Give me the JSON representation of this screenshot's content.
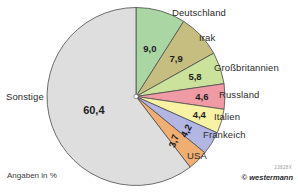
{
  "figure": {
    "footnote": "Angaben in %",
    "credit": "© westermann",
    "credit_code": "23828X"
  },
  "chart_data": {
    "type": "pie",
    "title": "",
    "unit": "%",
    "note": "Angaben in %",
    "start_angle_deg": 0,
    "direction": "clockwise",
    "categories": [
      "Deutschland",
      "Irak",
      "Großbritannien",
      "Russland",
      "Italien",
      "Frankeich",
      "USA",
      "Sonstige"
    ],
    "values": [
      9.0,
      7.9,
      5.8,
      4.6,
      4.4,
      4.2,
      3.7,
      60.4
    ],
    "value_labels": [
      "9,0",
      "7,9",
      "5,8",
      "4,6",
      "4,4",
      "4,2",
      "3,7",
      "60,4"
    ],
    "colors": [
      "#a9d6a2",
      "#c6bd81",
      "#cbe29c",
      "#ef9aa5",
      "#f7f2a4",
      "#b2b6e2",
      "#f0ae72",
      "#dedede"
    ],
    "slices": [
      {
        "label": "Deutschland",
        "value": 9.0,
        "value_label": "9,0",
        "color": "#a9d6a2"
      },
      {
        "label": "Irak",
        "value": 7.9,
        "value_label": "7,9",
        "color": "#c6bd81"
      },
      {
        "label": "Großbritannien",
        "value": 5.8,
        "value_label": "5,8",
        "color": "#cbe29c"
      },
      {
        "label": "Russland",
        "value": 4.6,
        "value_label": "4,6",
        "color": "#ef9aa5"
      },
      {
        "label": "Italien",
        "value": 4.4,
        "value_label": "4,4",
        "color": "#f7f2a4"
      },
      {
        "label": "Frankeich",
        "value": 4.2,
        "value_label": "4,2",
        "color": "#b2b6e2"
      },
      {
        "label": "USA",
        "value": 3.7,
        "value_label": "3,7",
        "color": "#f0ae72"
      },
      {
        "label": "Sonstige",
        "value": 60.4,
        "value_label": "60,4",
        "color": "#dedede"
      }
    ],
    "legend_position": "outside-radial"
  }
}
